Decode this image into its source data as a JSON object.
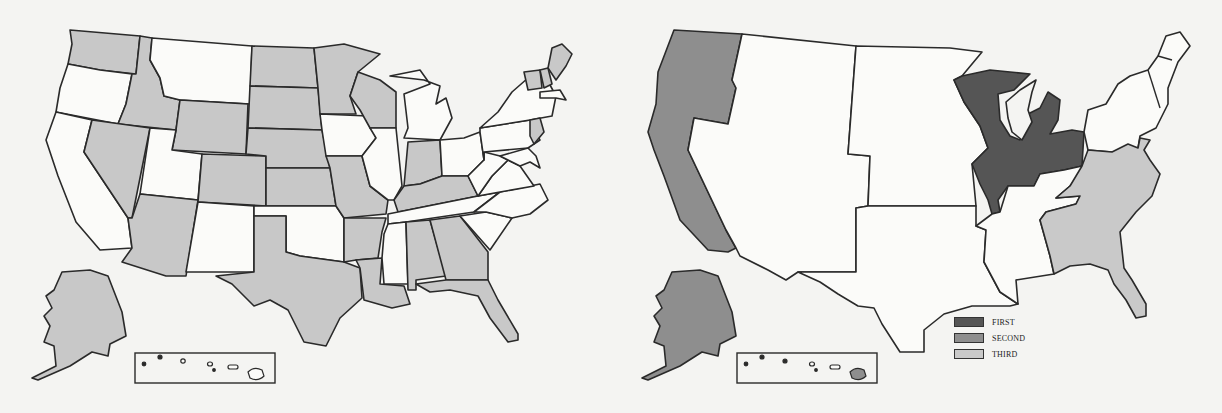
{
  "figure": {
    "background_color": "#f4f4f2",
    "stroke_color": "#2a2a2a",
    "colors": {
      "unshaded": "#fbfbf9",
      "shaded_left": "#c8c8c8",
      "first": "#555555",
      "second": "#8e8e8e",
      "third": "#c9c9c9"
    }
  },
  "left_map": {
    "description": "US states map, shaded states in light gray",
    "shaded_states": [
      "Washington",
      "Idaho",
      "Wyoming",
      "Nevada",
      "Arizona",
      "Colorado",
      "North Dakota",
      "South Dakota",
      "Nebraska",
      "Kansas",
      "Minnesota",
      "Wisconsin",
      "Missouri",
      "Arkansas",
      "Louisiana",
      "Texas",
      "Indiana",
      "Kentucky",
      "Alabama",
      "Georgia",
      "Florida",
      "Alaska",
      "Maine",
      "Vermont",
      "New Hampshire",
      "New Jersey"
    ],
    "unshaded_states": [
      "Oregon",
      "California",
      "Montana",
      "Utah",
      "New Mexico",
      "Oklahoma",
      "Iowa",
      "Illinois",
      "Michigan",
      "Ohio",
      "Tennessee",
      "Mississippi",
      "South Carolina",
      "North Carolina",
      "Virginia",
      "West Virginia",
      "Pennsylvania",
      "New York",
      "Massachusetts",
      "Connecticut",
      "Rhode Island",
      "Maryland",
      "Delaware",
      "Hawaii"
    ]
  },
  "right_map": {
    "description": "US regions map shaded by rank",
    "regions": [
      {
        "name": "Great Lakes region (WI, IL, IN, MI, OH)",
        "rank": "FIRST"
      },
      {
        "name": "Pacific (WA, OR, CA, AK, HI)",
        "rank": "SECOND"
      },
      {
        "name": "South Atlantic (DE, MD, VA, WV, NC, SC, GA, FL)",
        "rank": "THIRD"
      }
    ]
  },
  "legend": {
    "items": [
      {
        "label": "FIRST",
        "color": "#555555"
      },
      {
        "label": "SECOND",
        "color": "#8e8e8e"
      },
      {
        "label": "THIRD",
        "color": "#c9c9c9"
      }
    ]
  }
}
